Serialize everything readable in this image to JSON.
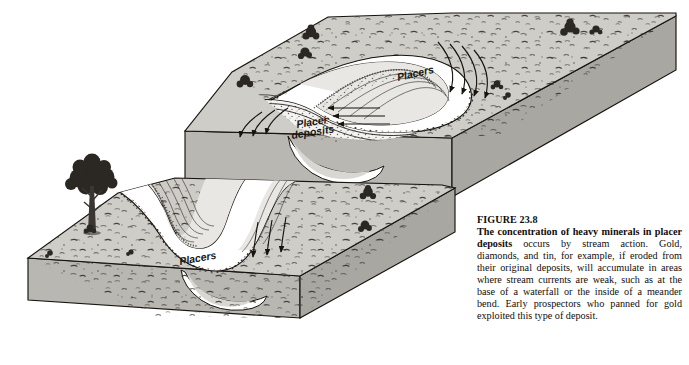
{
  "figure": {
    "number_label": "FIGURE 23.8",
    "lead_text": "The concentration of heavy minerals in placer deposits",
    "body_text": " occurs by stream action. Gold, diamonds, and tin, for example, if eroded from their original deposits, will accumulate in areas where stream currents are weak, such as at the base of a waterfall or the inside of a meander bend. Early prospectors who panned for gold exploited this type of deposit."
  },
  "diagram": {
    "type": "geology-block-diagram",
    "upper_block": {
      "name": "upper-block-diagram",
      "labels": {
        "placers": "Placers",
        "placer_deposits_line1": "Placer",
        "placer_deposits_line2": "deposits"
      },
      "features": [
        "meandering-stream-channel",
        "point-bar-accretion-ridges",
        "cut-bank",
        "flow-direction-arrows",
        "vegetation-shrubs",
        "speckled-ground-texture"
      ]
    },
    "lower_block": {
      "name": "lower-block-diagram",
      "labels": {
        "placers": "Placers"
      },
      "features": [
        "meandering-stream-channel",
        "point-bar-accretion-ridges",
        "cut-bank",
        "flow-direction-arrows",
        "deciduous-tree",
        "vegetation-shrubs",
        "speckled-ground-texture"
      ]
    }
  },
  "colors": {
    "ink": "#17130f",
    "top_surface": "#cfcdc8",
    "top_surface_light": "#d9d7d2",
    "side_face": "#b9b7b2",
    "side_face_dark": "#a9a7a2",
    "channel_fill": "#ffffff",
    "point_bar": "#e8e7e3",
    "placer_dots": "#6b6862",
    "vegetation": "#2b2723",
    "page_background": "#ffffff",
    "caption_text": "#100d0b"
  }
}
